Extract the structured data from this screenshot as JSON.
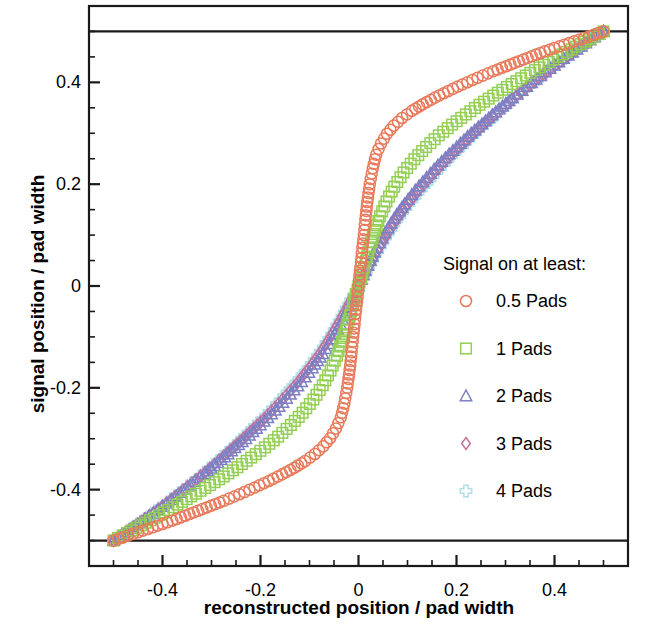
{
  "chart_data": {
    "type": "scatter",
    "title": "",
    "xlabel": "reconstructed position / pad width",
    "ylabel": "signal position / pad width",
    "xlim": [
      -0.55,
      0.55
    ],
    "ylim": [
      -0.55,
      0.55
    ],
    "xticks": [
      "-0.4",
      "-0.2",
      "0",
      "0.2",
      "0.4"
    ],
    "xtick_values": [
      -0.4,
      -0.2,
      0,
      0.2,
      0.4
    ],
    "yticks": [
      "0.4",
      "0.2",
      "0",
      "-0.2",
      "-0.4"
    ],
    "ytick_values": [
      0.4,
      0.2,
      0,
      -0.2,
      -0.4
    ],
    "minor_tick_step": 0.05,
    "grid": false,
    "reference_lines": [
      {
        "axis": "y",
        "value": 0.5
      },
      {
        "axis": "y",
        "value": -0.5
      }
    ],
    "legend_position": "center-right",
    "legend_title": "Signal on at least:",
    "series": [
      {
        "name": "0.5 Pads",
        "marker": "circle",
        "color": "#e8795a",
        "x": [
          -0.5,
          -0.46,
          -0.42,
          -0.38,
          -0.345,
          -0.31,
          -0.275,
          -0.243,
          -0.212,
          -0.183,
          -0.156,
          -0.131,
          -0.109,
          -0.089,
          -0.072,
          -0.058,
          -0.046,
          -0.036,
          -0.029,
          -0.023,
          -0.018,
          -0.014,
          -0.011,
          -0.008,
          -0.006,
          -0.004,
          -0.002,
          0,
          0.002,
          0.004,
          0.006,
          0.008,
          0.011,
          0.014,
          0.018,
          0.023,
          0.029,
          0.036,
          0.046,
          0.058,
          0.072,
          0.089,
          0.109,
          0.131,
          0.156,
          0.183,
          0.212,
          0.243,
          0.275,
          0.31,
          0.345,
          0.38,
          0.42,
          0.46,
          0.5
        ],
        "y": [
          -0.5,
          -0.487,
          -0.474,
          -0.461,
          -0.448,
          -0.435,
          -0.422,
          -0.409,
          -0.396,
          -0.383,
          -0.37,
          -0.357,
          -0.344,
          -0.33,
          -0.315,
          -0.299,
          -0.28,
          -0.258,
          -0.231,
          -0.2,
          -0.165,
          -0.13,
          -0.1,
          -0.075,
          -0.055,
          -0.038,
          -0.022,
          0,
          0.022,
          0.038,
          0.055,
          0.075,
          0.1,
          0.13,
          0.165,
          0.2,
          0.231,
          0.258,
          0.28,
          0.299,
          0.315,
          0.33,
          0.344,
          0.357,
          0.37,
          0.383,
          0.396,
          0.409,
          0.422,
          0.435,
          0.448,
          0.461,
          0.474,
          0.487,
          0.5
        ]
      },
      {
        "name": "1 Pads",
        "marker": "square",
        "color": "#93cf52",
        "x": [
          -0.5,
          -0.472,
          -0.444,
          -0.416,
          -0.388,
          -0.36,
          -0.332,
          -0.303,
          -0.275,
          -0.247,
          -0.219,
          -0.191,
          -0.164,
          -0.138,
          -0.114,
          -0.092,
          -0.073,
          -0.057,
          -0.044,
          -0.034,
          -0.026,
          -0.02,
          -0.015,
          -0.011,
          -0.008,
          -0.005,
          -0.002,
          0,
          0.002,
          0.005,
          0.008,
          0.011,
          0.015,
          0.02,
          0.026,
          0.034,
          0.044,
          0.057,
          0.073,
          0.092,
          0.114,
          0.138,
          0.164,
          0.191,
          0.219,
          0.247,
          0.275,
          0.303,
          0.332,
          0.36,
          0.388,
          0.416,
          0.444,
          0.472,
          0.5
        ],
        "y": [
          -0.5,
          -0.485,
          -0.47,
          -0.455,
          -0.44,
          -0.424,
          -0.408,
          -0.391,
          -0.374,
          -0.356,
          -0.337,
          -0.317,
          -0.296,
          -0.273,
          -0.249,
          -0.223,
          -0.195,
          -0.166,
          -0.137,
          -0.11,
          -0.086,
          -0.066,
          -0.05,
          -0.036,
          -0.025,
          -0.016,
          -0.007,
          0,
          0.007,
          0.016,
          0.025,
          0.036,
          0.05,
          0.066,
          0.086,
          0.11,
          0.137,
          0.166,
          0.195,
          0.223,
          0.249,
          0.273,
          0.296,
          0.317,
          0.337,
          0.356,
          0.374,
          0.391,
          0.408,
          0.424,
          0.44,
          0.455,
          0.47,
          0.485,
          0.5
        ]
      },
      {
        "name": "2 Pads",
        "marker": "triangle",
        "color": "#7b7fc4",
        "x": [
          -0.5,
          -0.482,
          -0.464,
          -0.446,
          -0.428,
          -0.409,
          -0.391,
          -0.372,
          -0.353,
          -0.334,
          -0.314,
          -0.294,
          -0.273,
          -0.252,
          -0.23,
          -0.208,
          -0.185,
          -0.162,
          -0.139,
          -0.116,
          -0.094,
          -0.073,
          -0.054,
          -0.037,
          -0.024,
          -0.014,
          -0.006,
          0,
          0.006,
          0.014,
          0.024,
          0.037,
          0.054,
          0.073,
          0.094,
          0.116,
          0.139,
          0.162,
          0.185,
          0.208,
          0.23,
          0.252,
          0.273,
          0.294,
          0.314,
          0.334,
          0.353,
          0.372,
          0.391,
          0.409,
          0.428,
          0.446,
          0.464,
          0.482,
          0.5
        ],
        "y": [
          -0.5,
          -0.489,
          -0.477,
          -0.465,
          -0.453,
          -0.44,
          -0.427,
          -0.413,
          -0.399,
          -0.384,
          -0.369,
          -0.353,
          -0.336,
          -0.318,
          -0.3,
          -0.28,
          -0.259,
          -0.237,
          -0.213,
          -0.188,
          -0.161,
          -0.133,
          -0.104,
          -0.075,
          -0.05,
          -0.03,
          -0.013,
          0,
          0.013,
          0.03,
          0.05,
          0.075,
          0.104,
          0.133,
          0.161,
          0.188,
          0.213,
          0.237,
          0.259,
          0.28,
          0.3,
          0.318,
          0.336,
          0.353,
          0.369,
          0.384,
          0.399,
          0.413,
          0.427,
          0.44,
          0.453,
          0.465,
          0.477,
          0.489,
          0.5
        ]
      },
      {
        "name": "3 Pads",
        "marker": "diamond",
        "color": "#c4739c",
        "x": [
          -0.5,
          -0.484,
          -0.468,
          -0.451,
          -0.435,
          -0.418,
          -0.401,
          -0.384,
          -0.367,
          -0.349,
          -0.331,
          -0.313,
          -0.294,
          -0.275,
          -0.255,
          -0.235,
          -0.214,
          -0.192,
          -0.17,
          -0.147,
          -0.124,
          -0.101,
          -0.078,
          -0.057,
          -0.039,
          -0.024,
          -0.011,
          0,
          0.011,
          0.024,
          0.039,
          0.057,
          0.078,
          0.101,
          0.124,
          0.147,
          0.17,
          0.192,
          0.214,
          0.235,
          0.255,
          0.275,
          0.294,
          0.313,
          0.331,
          0.349,
          0.367,
          0.384,
          0.401,
          0.418,
          0.435,
          0.451,
          0.468,
          0.484,
          0.5
        ],
        "y": [
          -0.5,
          -0.49,
          -0.479,
          -0.468,
          -0.457,
          -0.445,
          -0.433,
          -0.421,
          -0.408,
          -0.394,
          -0.38,
          -0.366,
          -0.35,
          -0.334,
          -0.317,
          -0.299,
          -0.28,
          -0.26,
          -0.238,
          -0.214,
          -0.189,
          -0.161,
          -0.131,
          -0.099,
          -0.069,
          -0.042,
          -0.019,
          0,
          0.019,
          0.042,
          0.069,
          0.099,
          0.131,
          0.161,
          0.189,
          0.214,
          0.238,
          0.26,
          0.28,
          0.299,
          0.317,
          0.334,
          0.35,
          0.366,
          0.38,
          0.394,
          0.408,
          0.421,
          0.433,
          0.445,
          0.457,
          0.468,
          0.479,
          0.49,
          0.5
        ]
      },
      {
        "name": "4 Pads",
        "marker": "cross",
        "color": "#aee0ea",
        "x": [
          -0.5,
          -0.486,
          -0.471,
          -0.457,
          -0.442,
          -0.427,
          -0.412,
          -0.396,
          -0.381,
          -0.365,
          -0.348,
          -0.331,
          -0.314,
          -0.296,
          -0.278,
          -0.259,
          -0.239,
          -0.219,
          -0.197,
          -0.175,
          -0.152,
          -0.128,
          -0.103,
          -0.078,
          -0.055,
          -0.034,
          -0.016,
          0,
          0.016,
          0.034,
          0.055,
          0.078,
          0.103,
          0.128,
          0.152,
          0.175,
          0.197,
          0.219,
          0.239,
          0.259,
          0.278,
          0.296,
          0.314,
          0.331,
          0.348,
          0.365,
          0.381,
          0.396,
          0.412,
          0.427,
          0.442,
          0.457,
          0.471,
          0.486,
          0.5
        ],
        "y": [
          -0.5,
          -0.491,
          -0.482,
          -0.472,
          -0.462,
          -0.452,
          -0.441,
          -0.43,
          -0.418,
          -0.406,
          -0.393,
          -0.38,
          -0.366,
          -0.351,
          -0.335,
          -0.319,
          -0.301,
          -0.282,
          -0.262,
          -0.24,
          -0.216,
          -0.19,
          -0.161,
          -0.129,
          -0.095,
          -0.06,
          -0.028,
          0,
          0.028,
          0.06,
          0.095,
          0.129,
          0.161,
          0.19,
          0.216,
          0.24,
          0.262,
          0.282,
          0.301,
          0.319,
          0.335,
          0.351,
          0.366,
          0.38,
          0.393,
          0.406,
          0.418,
          0.43,
          0.441,
          0.452,
          0.462,
          0.472,
          0.482,
          0.491,
          0.5
        ]
      }
    ]
  },
  "legend": {
    "title": "Signal on at least:",
    "items": [
      {
        "label": "0.5 Pads",
        "marker": "circle",
        "color": "#e8795a"
      },
      {
        "label": "1 Pads",
        "marker": "square",
        "color": "#93cf52"
      },
      {
        "label": "2 Pads",
        "marker": "triangle",
        "color": "#7b7fc4"
      },
      {
        "label": "3 Pads",
        "marker": "diamond",
        "color": "#c4739c"
      },
      {
        "label": "4 Pads",
        "marker": "cross",
        "color": "#aee0ea"
      }
    ]
  },
  "axes": {
    "xlabel": "reconstructed position / pad width",
    "ylabel": "signal position / pad width",
    "xticks": [
      "-0.4",
      "-0.2",
      "0",
      "0.2",
      "0.4"
    ],
    "yticks": [
      "0.4",
      "0.2",
      "0",
      "-0.2",
      "-0.4"
    ]
  },
  "colors": {
    "axis": "#1a1a1a",
    "background": "#ffffff",
    "text": "#000000"
  }
}
